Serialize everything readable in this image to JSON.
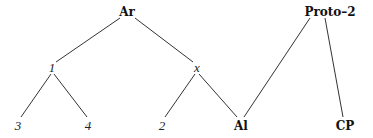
{
  "diagram": {
    "type": "tree",
    "nodes": [
      {
        "id": "Ar",
        "label": "Ar",
        "style": "bold",
        "x": 127,
        "y": 12
      },
      {
        "id": "Proto-2",
        "label": "Proto–2",
        "style": "bold",
        "x": 330,
        "y": 12
      },
      {
        "id": "n1",
        "label": "1",
        "style": "italic",
        "x": 52,
        "y": 68
      },
      {
        "id": "nx",
        "label": "x",
        "style": "italic",
        "x": 197,
        "y": 68
      },
      {
        "id": "n3",
        "label": "3",
        "style": "italic",
        "x": 18,
        "y": 126
      },
      {
        "id": "n4",
        "label": "4",
        "style": "italic",
        "x": 88,
        "y": 126
      },
      {
        "id": "n2",
        "label": "2",
        "style": "italic",
        "x": 162,
        "y": 126
      },
      {
        "id": "Al",
        "label": "Al",
        "style": "bold",
        "x": 241,
        "y": 126
      },
      {
        "id": "CP",
        "label": "CP",
        "style": "bold",
        "x": 345,
        "y": 126
      }
    ],
    "edges": [
      {
        "from": "Ar",
        "to": "n1"
      },
      {
        "from": "Ar",
        "to": "nx"
      },
      {
        "from": "n1",
        "to": "n3"
      },
      {
        "from": "n1",
        "to": "n4"
      },
      {
        "from": "nx",
        "to": "n2"
      },
      {
        "from": "nx",
        "to": "Al"
      },
      {
        "from": "Proto-2",
        "to": "Al"
      },
      {
        "from": "Proto-2",
        "to": "CP"
      }
    ]
  }
}
